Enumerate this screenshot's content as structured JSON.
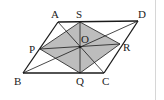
{
  "diagram": {
    "type": "geometry",
    "colors": {
      "stroke": "#1a1a1a",
      "fill_shaded": "#bdbdbd",
      "background": "#ffffff",
      "border": "#d6d6d6"
    },
    "points": {
      "A": {
        "label": "A",
        "x": 58,
        "y": 22,
        "lx": 51,
        "ly": 18
      },
      "S": {
        "label": "S",
        "x": 80,
        "y": 22,
        "lx": 76,
        "ly": 18
      },
      "D": {
        "label": "D",
        "x": 138,
        "y": 21,
        "lx": 138,
        "ly": 18
      },
      "P": {
        "label": "P",
        "x": 40,
        "y": 49,
        "lx": 29,
        "ly": 53
      },
      "O": {
        "label": "O",
        "x": 80,
        "y": 47,
        "lx": 81,
        "ly": 43
      },
      "R": {
        "label": "R",
        "x": 120,
        "y": 44,
        "lx": 123,
        "ly": 51
      },
      "B": {
        "label": "B",
        "x": 23,
        "y": 73,
        "lx": 14,
        "ly": 85
      },
      "Q": {
        "label": "Q",
        "x": 80,
        "y": 73,
        "lx": 76,
        "ly": 85
      },
      "C": {
        "label": "C",
        "x": 104,
        "y": 73,
        "lx": 102,
        "ly": 85
      }
    },
    "segments": [
      "AD",
      "DC",
      "CB",
      "BA",
      "AC",
      "BD",
      "PR",
      "SQ",
      "PS",
      "SR",
      "RQ",
      "QP"
    ],
    "shaded_polygon": [
      "P",
      "S",
      "R",
      "Q"
    ]
  }
}
